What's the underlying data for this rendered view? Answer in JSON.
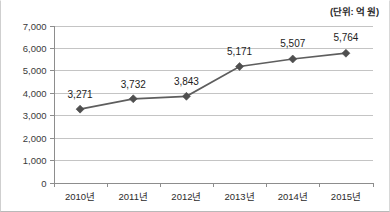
{
  "chart_data": {
    "type": "line",
    "title": "",
    "subtitle": "",
    "unit_note": "(단위: 억 원)",
    "xlabel": "",
    "ylabel": "",
    "categories": [
      "2010년",
      "2011년",
      "2012년",
      "2013년",
      "2014년",
      "2015년"
    ],
    "values": [
      3271,
      3732,
      3843,
      5171,
      5507,
      5764
    ],
    "point_labels": [
      "3,271",
      "3,732",
      "3,843",
      "5,171",
      "5,507",
      "5,764"
    ],
    "ylim": [
      0,
      7000
    ],
    "ytick_values": [
      0,
      1000,
      2000,
      3000,
      4000,
      5000,
      6000,
      7000
    ],
    "ytick_labels": [
      "0",
      "1,000",
      "2,000",
      "3,000",
      "4,000",
      "5,000",
      "6,000",
      "7,000"
    ],
    "grid": true,
    "legend": false,
    "legend_position": "none",
    "marker": "diamond",
    "series_color": "#5e5e5e",
    "grid_color": "#c4c4c4",
    "axis_color": "#8d8d8d",
    "background_color": "#ffffff"
  }
}
